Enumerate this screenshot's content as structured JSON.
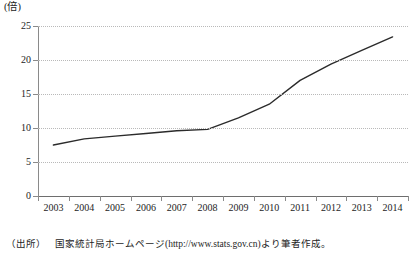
{
  "chart_data": {
    "type": "line",
    "title": "",
    "xlabel": "",
    "ylabel": "",
    "yunit": "(倍)",
    "categories": [
      "2003",
      "2004",
      "2005",
      "2006",
      "2007",
      "2008",
      "2009",
      "2010",
      "2011",
      "2012",
      "2013",
      "2014"
    ],
    "x": [
      2003,
      2004,
      2005,
      2006,
      2007,
      2008,
      2009,
      2010,
      2011,
      2012,
      2013,
      2014
    ],
    "values": [
      7.5,
      8.4,
      8.8,
      9.2,
      9.6,
      9.8,
      11.5,
      13.5,
      17.0,
      19.4,
      21.4,
      23.4
    ],
    "series": [
      {
        "name": "倍率",
        "values": [
          7.5,
          8.4,
          8.8,
          9.2,
          9.6,
          9.8,
          11.5,
          13.5,
          17.0,
          19.4,
          21.4,
          23.4
        ]
      }
    ],
    "ylim": [
      0,
      25
    ],
    "yticks": [
      0,
      5,
      10,
      15,
      20,
      25
    ],
    "ytick_labels": [
      "0",
      "5",
      "10",
      "15",
      "20",
      "25"
    ],
    "grid": true,
    "grid_axis": "y",
    "grid_style": "dotted",
    "legend": false,
    "legend_position": "none",
    "line_color": "#2b2b2b",
    "grid_color": "#b9b9b9",
    "axis_color": "#6e6e6e"
  },
  "source": {
    "label": "（出所）",
    "text": "国家統計局ホームページ(http://www.stats.gov.cn)より筆者作成。"
  }
}
